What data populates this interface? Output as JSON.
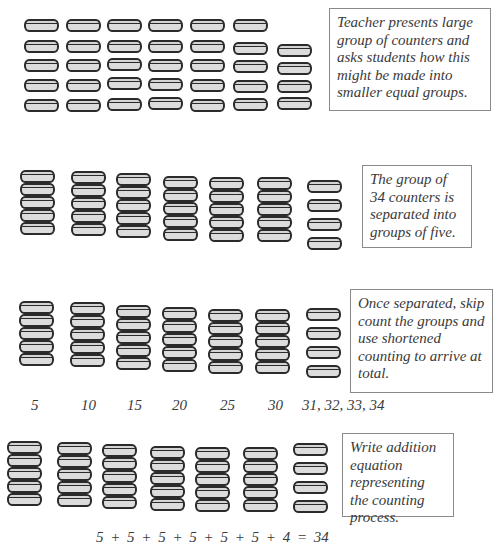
{
  "diagram": {
    "colors": {
      "counter_fill": "#dcdcdc",
      "counter_outline": "#2b2b2b",
      "box_border": "#8a8a8a",
      "text": "#3a3a3a"
    },
    "steps": [
      {
        "id": "step-1",
        "note": "Teacher presents large group of counters and asks students how this might be made into smaller equal groups.",
        "note_box": {
          "x": 329,
          "y": 8,
          "w": 162,
          "h": 103
        },
        "columns": [
          {
            "x": 24,
            "ys": [
              19,
              40,
              59,
              79,
              99
            ]
          },
          {
            "x": 66,
            "ys": [
              19,
              40,
              59,
              79,
              99
            ]
          },
          {
            "x": 107,
            "ys": [
              19,
              40,
              58,
              77,
              98
            ]
          },
          {
            "x": 148,
            "ys": [
              19,
              40,
              59,
              78,
              97
            ]
          },
          {
            "x": 190,
            "ys": [
              19,
              40,
              59,
              79,
              99
            ]
          },
          {
            "x": 233,
            "ys": [
              19,
              42,
              60,
              80,
              98
            ]
          },
          {
            "x": 277,
            "ys": [
              44,
              62,
              80,
              97
            ]
          }
        ],
        "total_counters": 34
      },
      {
        "id": "step-2",
        "note": "The group of 34 counters is separated into groups of five.",
        "note_box": {
          "x": 362,
          "y": 165,
          "w": 110,
          "h": 83
        },
        "columns": [
          {
            "x": 20,
            "offset": 170
          },
          {
            "x": 71,
            "offset": 171
          },
          {
            "x": 116,
            "offset": 173
          },
          {
            "x": 163,
            "offset": 176
          },
          {
            "x": 209,
            "offset": 177
          },
          {
            "x": 257,
            "offset": 177
          },
          {
            "x": 307,
            "offset": 180,
            "count": 4
          }
        ],
        "group_sizes": [
          5,
          5,
          5,
          5,
          5,
          5,
          4
        ]
      },
      {
        "id": "step-3",
        "note": "Once separated, skip count the groups and use shortened counting to arrive at total.",
        "note_box": {
          "x": 350,
          "y": 289,
          "w": 143,
          "h": 104
        },
        "columns": [
          {
            "x": 19,
            "offset": 301
          },
          {
            "x": 70,
            "offset": 302
          },
          {
            "x": 116,
            "offset": 305
          },
          {
            "x": 162,
            "offset": 307
          },
          {
            "x": 208,
            "offset": 309
          },
          {
            "x": 255,
            "offset": 309
          },
          {
            "x": 306,
            "offset": 308,
            "count": 4
          }
        ],
        "skip_count_labels": [
          {
            "text": "5",
            "x": 31
          },
          {
            "text": "10",
            "x": 81
          },
          {
            "text": "15",
            "x": 127
          },
          {
            "text": "20",
            "x": 172
          },
          {
            "text": "25",
            "x": 220
          },
          {
            "text": "30",
            "x": 268
          },
          {
            "text": "31, 32, 33, 34",
            "x": 302
          }
        ],
        "labels_y": 397
      },
      {
        "id": "step-4",
        "note": "Write addition equation representing the counting process.",
        "note_box": {
          "x": 342,
          "y": 433,
          "w": 112,
          "h": 84
        },
        "columns": [
          {
            "x": 7,
            "offset": 441
          },
          {
            "x": 57,
            "offset": 442
          },
          {
            "x": 102,
            "offset": 444
          },
          {
            "x": 150,
            "offset": 446
          },
          {
            "x": 195,
            "offset": 447
          },
          {
            "x": 243,
            "offset": 447
          },
          {
            "x": 293,
            "offset": 443,
            "count": 4
          }
        ],
        "equation": "5 + 5 + 5 + 5 + 5 + 5 + 4 = 34",
        "equation_pos": {
          "x": 96,
          "y": 529
        }
      }
    ]
  }
}
